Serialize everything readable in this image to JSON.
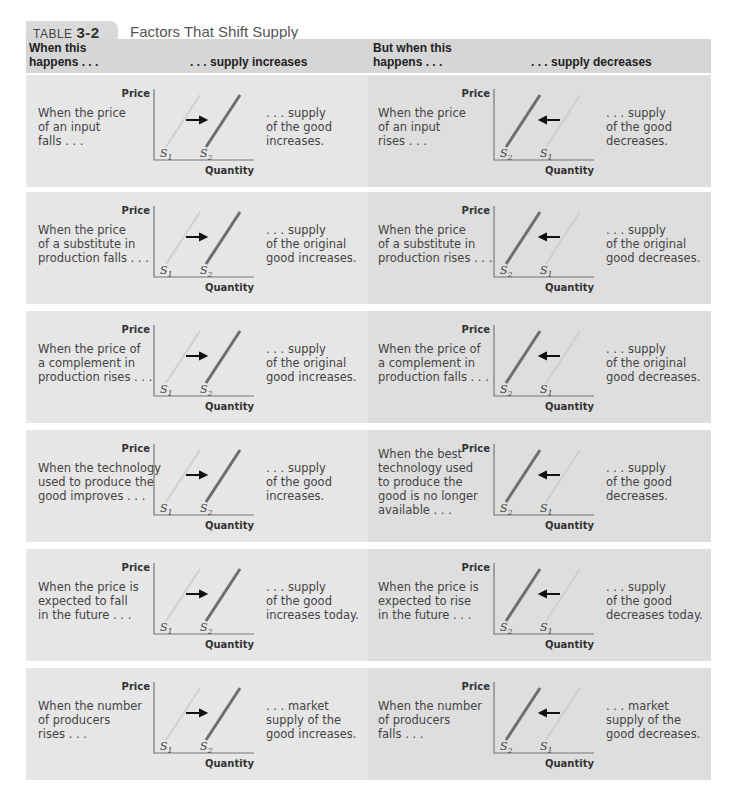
{
  "table": {
    "label": "TABLE",
    "number": "3-2",
    "title": "Factors That Shift Supply"
  },
  "headers": {
    "left_cause": [
      "When this",
      "happens . . ."
    ],
    "left_effect": ". . . supply increases",
    "right_cause": [
      "But when this",
      "happens . . ."
    ],
    "right_effect": ". . . supply decreases"
  },
  "axis": {
    "y": "Price",
    "x": "Quantity"
  },
  "colors": {
    "shifted_curve": "#6e6e6e",
    "original_curve": "#cfcfcf",
    "arrow": "#111111",
    "left_bg": "#e6e6e6",
    "right_bg": "#dedede",
    "header_bg": "#d6d6d6"
  },
  "rows": [
    {
      "increase": {
        "cause": [
          "When the price",
          "of an input",
          "falls . . ."
        ],
        "effect": [
          ". . . supply",
          "of the good",
          "increases."
        ]
      },
      "decrease": {
        "cause": [
          "When the price",
          "of an input",
          "rises . . ."
        ],
        "effect": [
          ". . . supply",
          "of the good",
          "decreases."
        ]
      }
    },
    {
      "increase": {
        "cause": [
          "When the price",
          "of a substitute in",
          "production falls . . ."
        ],
        "effect": [
          ". . . supply",
          "of the original",
          "good increases."
        ]
      },
      "decrease": {
        "cause": [
          "When the price",
          "of a substitute in",
          "production rises . . ."
        ],
        "effect": [
          ". . . supply",
          "of the original",
          "good decreases."
        ]
      }
    },
    {
      "increase": {
        "cause": [
          "When the price of",
          "a complement in",
          "production rises . . ."
        ],
        "effect": [
          ". . . supply",
          "of the original",
          "good increases."
        ]
      },
      "decrease": {
        "cause": [
          "When the price of",
          "a complement in",
          "production falls . . ."
        ],
        "effect": [
          ". . . supply",
          "of the original",
          "good decreases."
        ]
      }
    },
    {
      "increase": {
        "cause": [
          "When the technology",
          "used to produce the",
          "good improves . . ."
        ],
        "effect": [
          ". . . supply",
          "of the good",
          "increases."
        ]
      },
      "decrease": {
        "cause": [
          "When the best",
          "technology used",
          "to produce the",
          "good is no longer",
          "available . . ."
        ],
        "effect": [
          ". . . supply",
          "of the good",
          "decreases."
        ]
      }
    },
    {
      "increase": {
        "cause": [
          "When the price is",
          "expected to fall",
          "in the future . . ."
        ],
        "effect": [
          ". . . supply",
          "of the good",
          "increases today."
        ]
      },
      "decrease": {
        "cause": [
          "When the price is",
          "expected to rise",
          "in the future . . ."
        ],
        "effect": [
          ". . . supply",
          "of the good",
          "decreases today."
        ]
      }
    },
    {
      "increase": {
        "cause": [
          "When the number",
          "of producers",
          "rises . . ."
        ],
        "effect": [
          ". . . market",
          "supply of the",
          "good increases."
        ]
      },
      "decrease": {
        "cause": [
          "When the number",
          "of producers",
          "falls . . ."
        ],
        "effect": [
          ". . . market",
          "supply of the",
          "good decreases."
        ]
      }
    }
  ],
  "curve_labels": {
    "s1": "S",
    "s1_sub": "1",
    "s2": "S",
    "s2_sub": "2"
  }
}
